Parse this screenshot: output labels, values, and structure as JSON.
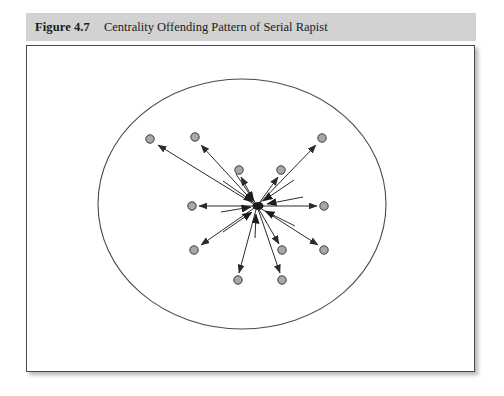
{
  "figure": {
    "label": "Figure 4.7",
    "title": "Centrality Offending Pattern of Serial Rapist",
    "caption_bar_color": "#d2d2d2",
    "canvas_border_color": "#4a4a4a",
    "canvas_background": "#ffffff"
  },
  "diagram": {
    "type": "node-link-centrality",
    "node_fill_color": "#a8a8a8",
    "node_stroke_color": "#3a3a3a",
    "line_color": "#2b2b2b",
    "boundary": {
      "shape": "ellipse",
      "cx": 215,
      "cy": 158,
      "rx": 144,
      "ry": 125,
      "stroke": "#4b4b4b"
    },
    "hub": {
      "name": "home-base-hub",
      "x": 230,
      "y": 160,
      "radius": 4
    },
    "nodes": [
      {
        "id": "n1",
        "name": "offence-site-upper-left-outer",
        "x": 123,
        "y": 93
      },
      {
        "id": "n2",
        "name": "offence-site-upper-left-mid",
        "x": 168,
        "y": 91
      },
      {
        "id": "n3",
        "name": "offence-site-upper-right-outer",
        "x": 295,
        "y": 92
      },
      {
        "id": "n4",
        "name": "offence-site-upper-inner-left",
        "x": 212,
        "y": 124
      },
      {
        "id": "n5",
        "name": "offence-site-upper-inner-right",
        "x": 254,
        "y": 124
      },
      {
        "id": "n6",
        "name": "offence-site-left",
        "x": 165,
        "y": 160
      },
      {
        "id": "n7",
        "name": "offence-site-right",
        "x": 297,
        "y": 160
      },
      {
        "id": "n8",
        "name": "offence-site-lower-left",
        "x": 167,
        "y": 204
      },
      {
        "id": "n9",
        "name": "offence-site-lower-inner-right",
        "x": 255,
        "y": 204
      },
      {
        "id": "n10",
        "name": "offence-site-lower-right",
        "x": 297,
        "y": 204
      },
      {
        "id": "n11",
        "name": "offence-site-bottom-left",
        "x": 211,
        "y": 234
      },
      {
        "id": "n12",
        "name": "offence-site-bottom-right",
        "x": 255,
        "y": 234
      }
    ],
    "links": [
      {
        "from": "hub",
        "to": "n1",
        "arrow": "end"
      },
      {
        "from": "hub",
        "to": "n2",
        "arrow": "end"
      },
      {
        "from": "hub",
        "to": "n3",
        "arrow": "end"
      },
      {
        "from": "hub",
        "to": "n4",
        "arrow": "end"
      },
      {
        "from": "hub",
        "to": "n5",
        "arrow": "end"
      },
      {
        "from": "hub",
        "to": "n6",
        "arrow": "end"
      },
      {
        "from": "hub",
        "to": "n7",
        "arrow": "end"
      },
      {
        "from": "hub",
        "to": "n8",
        "arrow": "end"
      },
      {
        "from": "hub",
        "to": "n9",
        "arrow": "end"
      },
      {
        "from": "hub",
        "to": "n10",
        "arrow": "end"
      },
      {
        "from": "hub",
        "to": "n11",
        "arrow": "end"
      },
      {
        "from": "hub",
        "to": "n12",
        "arrow": "end"
      }
    ],
    "inbound_arrowheads": [
      {
        "name": "inbound-arrow-from-upper-left",
        "angle": 215
      },
      {
        "name": "inbound-arrow-from-upper",
        "angle": 250
      },
      {
        "name": "inbound-arrow-from-upper-right",
        "angle": 300
      },
      {
        "name": "inbound-arrow-from-right",
        "angle": 340
      },
      {
        "name": "inbound-arrow-from-lower-left",
        "angle": 145
      },
      {
        "name": "inbound-arrow-from-lower",
        "angle": 95
      },
      {
        "name": "inbound-arrow-from-left",
        "angle": 185
      }
    ]
  }
}
